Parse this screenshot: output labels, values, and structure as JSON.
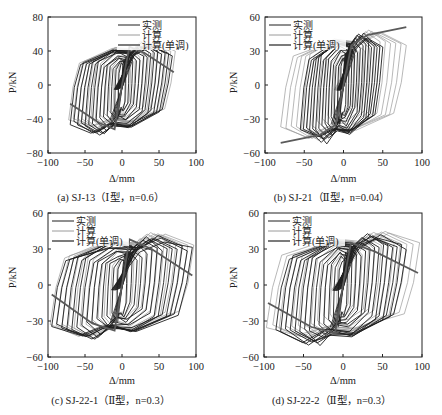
{
  "legend": {
    "measured": "实测",
    "calc": "计算",
    "calc_mono": "计算(单调)"
  },
  "colors": {
    "measured": "#1e1e1e",
    "calc": "#9a9a9a",
    "calc_mono": "#5a5a5a",
    "axis": "#222222"
  },
  "axis_labels": {
    "x": "Δ/mm",
    "y": "P/kN"
  },
  "chart_data": [
    {
      "id": "a",
      "type": "line",
      "title": "(a) SJ-13（Ⅰ型，n=0.6）",
      "xlabel": "Δ/mm",
      "ylabel": "P/kN",
      "xlim": [
        -100,
        100
      ],
      "ylim": [
        -80,
        80
      ],
      "xticks": [
        -100,
        -50,
        0,
        50,
        100
      ],
      "yticks": [
        -80,
        -40,
        0,
        40,
        80
      ],
      "grid": false,
      "legend_position": "upper right",
      "series": [
        {
          "name": "实测",
          "peak_pos_load": 48,
          "peak_neg_load": -58,
          "max_disp": 68,
          "min_disp": -70
        },
        {
          "name": "计算",
          "peak_pos_load": 52,
          "peak_neg_load": -52,
          "max_disp": 72,
          "min_disp": -72
        },
        {
          "name": "计算(单调)",
          "x": [
            -70,
            -30,
            -10,
            0,
            10,
            30,
            70
          ],
          "y": [
            -22,
            -45,
            -52,
            0,
            45,
            38,
            15
          ]
        }
      ]
    },
    {
      "id": "b",
      "type": "line",
      "title": "(b) SJ-21（Ⅱ型，n=0.04）",
      "xlabel": "Δ/mm",
      "ylabel": "P/kN",
      "xlim": [
        -100,
        100
      ],
      "ylim": [
        -60,
        60
      ],
      "xticks": [
        -100,
        -50,
        0,
        50,
        100
      ],
      "yticks": [
        -60,
        -30,
        0,
        30,
        60
      ],
      "grid": false,
      "legend_position": "upper left",
      "series": [
        {
          "name": "实测",
          "peak_pos_load": 45,
          "peak_neg_load": -50,
          "max_disp": 50,
          "min_disp": -55
        },
        {
          "name": "计算",
          "peak_pos_load": 48,
          "peak_neg_load": -48,
          "max_disp": 80,
          "min_disp": -80
        },
        {
          "name": "计算(单调)",
          "x": [
            -80,
            -30,
            -10,
            0,
            10,
            30,
            80
          ],
          "y": [
            -51,
            -44,
            -35,
            0,
            35,
            44,
            51
          ]
        }
      ]
    },
    {
      "id": "c",
      "type": "line",
      "title": "(c) SJ-22-1（Ⅱ型，n=0.3）",
      "xlabel": "Δ/mm",
      "ylabel": "P/kN",
      "xlim": [
        -100,
        100
      ],
      "ylim": [
        -60,
        60
      ],
      "xticks": [
        -100,
        -50,
        0,
        50,
        100
      ],
      "yticks": [
        -60,
        -30,
        0,
        30,
        60
      ],
      "grid": false,
      "legend_position": "upper left",
      "series": [
        {
          "name": "实测",
          "peak_pos_load": 40,
          "peak_neg_load": -45,
          "max_disp": 95,
          "min_disp": -95
        },
        {
          "name": "计算",
          "peak_pos_load": 44,
          "peak_neg_load": -44,
          "max_disp": 97,
          "min_disp": -97
        },
        {
          "name": "计算(单调)",
          "x": [
            -95,
            -40,
            -10,
            0,
            10,
            40,
            95
          ],
          "y": [
            -8,
            -32,
            -38,
            0,
            38,
            30,
            8
          ]
        }
      ]
    },
    {
      "id": "d",
      "type": "line",
      "title": "(d) SJ-22-2（Ⅱ型，n=0.3）",
      "xlabel": "Δ/mm",
      "ylabel": "P/kN",
      "xlim": [
        -100,
        100
      ],
      "ylim": [
        -60,
        60
      ],
      "xticks": [
        -100,
        -50,
        0,
        50,
        100
      ],
      "yticks": [
        -60,
        -30,
        0,
        30,
        60
      ],
      "grid": false,
      "legend_position": "upper left",
      "series": [
        {
          "name": "实测",
          "peak_pos_load": 42,
          "peak_neg_load": -50,
          "max_disp": 80,
          "min_disp": -85
        },
        {
          "name": "计算",
          "peak_pos_load": 45,
          "peak_neg_load": -45,
          "max_disp": 97,
          "min_disp": -97
        },
        {
          "name": "计算(单调)",
          "x": [
            -95,
            -40,
            -10,
            0,
            10,
            40,
            95
          ],
          "y": [
            -15,
            -35,
            -40,
            0,
            35,
            28,
            10
          ]
        }
      ]
    }
  ]
}
